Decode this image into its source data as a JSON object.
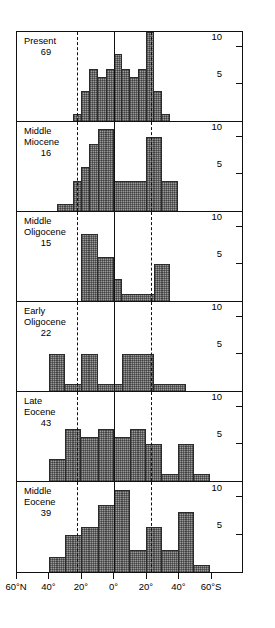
{
  "chart_data": {
    "type": "bar",
    "title": "",
    "subtitle": "",
    "xlabel": "Latitude",
    "ylabel": "Number of occurrences",
    "orientation": "stacked-panels",
    "grid": false,
    "legend": "none",
    "xlim": [
      -60,
      60
    ],
    "ylim": [
      0,
      12
    ],
    "x_axis": {
      "ticks": [
        -60,
        -40,
        -20,
        0,
        20,
        40,
        60
      ],
      "tick_labels": [
        "60°N",
        "40°",
        "20°",
        "0°",
        "20°",
        "40°",
        "60°S"
      ],
      "note": "negative = north, positive = south"
    },
    "y_axis": {
      "ticks": [
        5,
        10
      ],
      "tick_labels": [
        "5",
        "10"
      ]
    },
    "reference_lines": [
      {
        "name": "equator",
        "x": 0,
        "style": "solid"
      },
      {
        "name": "tropic-of-cancer",
        "x": -23,
        "style": "dashed"
      },
      {
        "name": "tropic-of-capricorn",
        "x": 23,
        "style": "dashed"
      }
    ],
    "bin_width": 5,
    "bin_edges": [
      -60,
      -55,
      -50,
      -45,
      -40,
      -35,
      -30,
      -25,
      -20,
      -15,
      -10,
      -5,
      0,
      5,
      10,
      15,
      20,
      25,
      30,
      35,
      40,
      45,
      50,
      55,
      60
    ],
    "panels": [
      {
        "id": "present",
        "label": "Present",
        "count_label": "69",
        "values": [
          0,
          0,
          0,
          0,
          0,
          0,
          0,
          1,
          4,
          7,
          6,
          7,
          9,
          7,
          6,
          7,
          12,
          4,
          1,
          0,
          0,
          0,
          0,
          0
        ]
      },
      {
        "id": "middle-miocene",
        "label": "Middle\nMiocene",
        "count_label": "16",
        "values": [
          0,
          0,
          0,
          0,
          0,
          1,
          1,
          4,
          6,
          9,
          11,
          11,
          4,
          4,
          4,
          4,
          10,
          10,
          4,
          4,
          0,
          0,
          0,
          0
        ]
      },
      {
        "id": "middle-oligocene",
        "label": "Middle\nOligocene",
        "count_label": "15",
        "values": [
          0,
          0,
          0,
          0,
          0,
          0,
          0,
          0,
          9,
          9,
          6,
          6,
          3,
          1,
          1,
          1,
          1,
          5,
          5,
          0,
          0,
          0,
          0,
          0
        ]
      },
      {
        "id": "early-oligocene",
        "label": "Early\nOligocene",
        "count_label": "22",
        "values": [
          0,
          0,
          0,
          0,
          5,
          5,
          1,
          1,
          5,
          5,
          1,
          1,
          1,
          5,
          5,
          5,
          5,
          1,
          1,
          1,
          1,
          0,
          0,
          0
        ]
      },
      {
        "id": "late-eocene",
        "label": "Late\nEocene",
        "count_label": "43",
        "values": [
          0,
          0,
          0,
          0,
          3,
          3,
          7,
          7,
          6,
          6,
          7,
          7,
          6,
          6,
          7,
          7,
          5,
          5,
          1,
          1,
          5,
          5,
          1,
          1
        ]
      },
      {
        "id": "middle-eocene",
        "label": "Middle\nEocene",
        "count_label": "39",
        "values": [
          0,
          0,
          0,
          0,
          2,
          2,
          5,
          5,
          6,
          6,
          9,
          9,
          11,
          11,
          3,
          3,
          6,
          6,
          3,
          3,
          8,
          8,
          1,
          1
        ]
      }
    ]
  }
}
